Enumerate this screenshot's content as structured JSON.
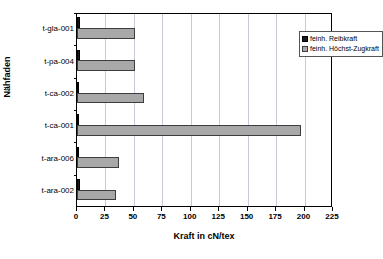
{
  "chart_data": {
    "type": "bar",
    "orientation": "horizontal",
    "title": "",
    "xlabel": "Kraft in cN/tex",
    "ylabel": "Nähfaden",
    "categories": [
      "t-ara-002",
      "t-ara-006",
      "t-ca-001",
      "t-ca-002",
      "t-pa-004",
      "t-gla-001"
    ],
    "categories_top_to_bottom": [
      "t-gla-001",
      "t-pa-004",
      "t-ca-002",
      "t-ca-001",
      "t-ara-006",
      "t-ara-002"
    ],
    "series": [
      {
        "name": "feinh. Reibkraft",
        "color": "#1a1a1a",
        "values": [
          2.5,
          0.8,
          1.2,
          1.0,
          2.2,
          3.0
        ]
      },
      {
        "name": "feinh. Höchst-Zugkraft",
        "color": "#a8a8a8",
        "values": [
          34,
          37,
          197,
          59,
          51,
          51
        ]
      }
    ],
    "xlim": [
      0,
      225
    ],
    "xticks": [
      0,
      25,
      50,
      75,
      100,
      125,
      150,
      175,
      200,
      225
    ],
    "xtick_labels": [
      "0",
      "25",
      "50",
      "75",
      "100",
      "125",
      "150",
      "175",
      "200",
      "225"
    ],
    "grid": "vertical",
    "legend_position": "top-right"
  },
  "legend": {
    "entries": [
      {
        "label": "feinh. Reibkraft"
      },
      {
        "label": "feinh. Höchst-Zugkraft"
      }
    ]
  },
  "axes": {
    "x_title": "Kraft in cN/tex",
    "y_title": "Nähfaden"
  }
}
